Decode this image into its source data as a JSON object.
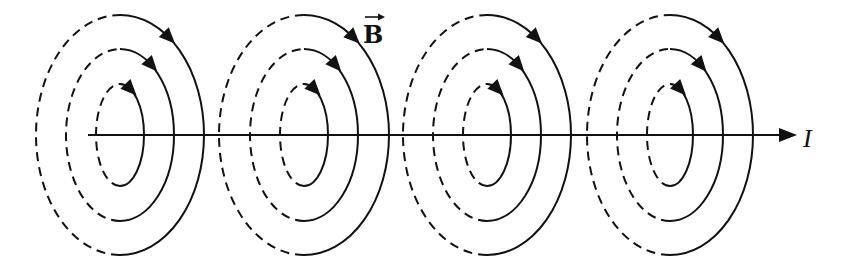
{
  "diagram": {
    "labels": {
      "field": "B",
      "current": "I"
    },
    "colors": {
      "stroke": "#111111",
      "background": "#ffffff"
    },
    "axis": {
      "y": 135,
      "x_start": 88,
      "x_end": 797
    },
    "groups": [
      {
        "cx": 120,
        "loops": [
          {
            "rx": 84,
            "ry": 120
          },
          {
            "rx": 54,
            "ry": 86
          },
          {
            "rx": 24,
            "ry": 51
          }
        ]
      },
      {
        "cx": 304,
        "loops": [
          {
            "rx": 85,
            "ry": 120
          },
          {
            "rx": 54,
            "ry": 86
          },
          {
            "rx": 24,
            "ry": 51
          }
        ]
      },
      {
        "cx": 487,
        "loops": [
          {
            "rx": 84,
            "ry": 120
          },
          {
            "rx": 54,
            "ry": 86
          },
          {
            "rx": 24,
            "ry": 51
          }
        ]
      },
      {
        "cx": 670,
        "loops": [
          {
            "rx": 83,
            "ry": 120
          },
          {
            "rx": 53,
            "ry": 86
          },
          {
            "rx": 23,
            "ry": 51
          }
        ]
      }
    ],
    "field_direction": "clockwise (viewed looking along current)",
    "loop_count_per_group": 3,
    "group_count": 4
  }
}
